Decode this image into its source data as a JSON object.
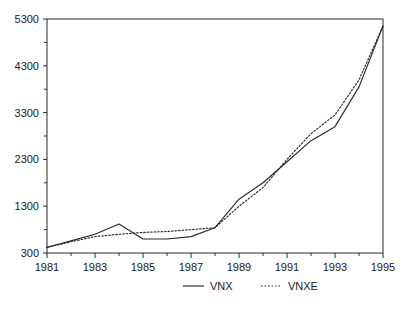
{
  "chart_data": {
    "type": "line",
    "title": "",
    "subtitle": "",
    "xlabel": "",
    "ylabel": "",
    "x": [
      1981,
      1982,
      1983,
      1984,
      1985,
      1986,
      1987,
      1988,
      1989,
      1990,
      1991,
      1992,
      1993,
      1994,
      1995
    ],
    "xtick_labels": [
      "1981",
      "1983",
      "1985",
      "1987",
      "1989",
      "1991",
      "1993",
      "1995"
    ],
    "xtick_values": [
      1981,
      1983,
      1985,
      1987,
      1989,
      1991,
      1993,
      1995
    ],
    "xminor_values": [
      1982,
      1984,
      1986,
      1988,
      1990,
      1992,
      1994
    ],
    "xlim": [
      1981,
      1995
    ],
    "ytick_labels": [
      "300",
      "1300",
      "2300",
      "3300",
      "4300",
      "5300"
    ],
    "ytick_values": [
      300,
      1300,
      2300,
      3300,
      4300,
      5300
    ],
    "yminor_values": [
      800,
      1800,
      2800,
      3800,
      4800
    ],
    "ylim": [
      300,
      5300
    ],
    "grid": false,
    "legend_position": "bottom",
    "series": [
      {
        "name": "VNX",
        "style": "solid",
        "color": "#2b2b2b",
        "values": [
          420,
          560,
          700,
          920,
          600,
          600,
          650,
          840,
          1450,
          1800,
          2250,
          2700,
          3000,
          3850,
          5150
        ]
      },
      {
        "name": "VNXE",
        "style": "dotted",
        "color": "#2b2b2b",
        "values": [
          420,
          540,
          650,
          700,
          740,
          760,
          800,
          840,
          1300,
          1700,
          2300,
          2850,
          3250,
          4000,
          5150
        ]
      }
    ]
  },
  "legend": {
    "items": [
      {
        "label": "VNX",
        "style": "solid"
      },
      {
        "label": "VNXE",
        "style": "dotted"
      }
    ]
  },
  "axes": {
    "y_labels": [
      "5300",
      "4300",
      "3300",
      "2300",
      "1300",
      "300"
    ],
    "x_labels": [
      "1981",
      "1983",
      "1985",
      "1987",
      "1989",
      "1991",
      "1993",
      "1995"
    ]
  }
}
